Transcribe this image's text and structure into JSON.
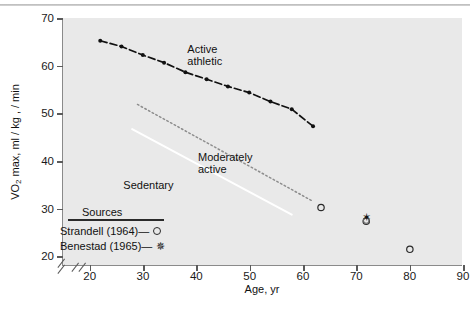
{
  "chart_data": {
    "type": "line",
    "title": "",
    "xlabel": "Age, yr",
    "ylabel": "VO2 max, ml/kg·/min",
    "ylabel_prefix": "VO",
    "ylabel_sub": "2",
    "ylabel_suffix": " max, ml / kg , / min",
    "xlim": [
      15,
      90
    ],
    "ylim": [
      18,
      70
    ],
    "xticks": [
      20,
      30,
      40,
      50,
      60,
      70,
      80,
      90
    ],
    "yticks": [
      20,
      30,
      40,
      50,
      60,
      70
    ],
    "grid": false,
    "legend_position": "inside-lower-left",
    "axis_break_x": true,
    "axis_break_y": true,
    "series": [
      {
        "name": "Active athletic",
        "style": "dash-dot-with-points",
        "color": "#111111",
        "label_lines": [
          "Active",
          "athletic"
        ],
        "x": [
          22,
          26,
          30,
          34,
          38,
          42,
          46,
          50,
          54,
          58,
          62
        ],
        "y": [
          65.2,
          64.0,
          62.2,
          60.6,
          58.6,
          57.1,
          55.6,
          54.3,
          52.4,
          50.8,
          47.2
        ]
      },
      {
        "name": "Moderately active",
        "style": "dotted",
        "color": "#8d8d8d",
        "label_lines": [
          "Moderately",
          "active"
        ],
        "x": [
          29,
          62
        ],
        "y": [
          51.8,
          31.4
        ]
      },
      {
        "name": "Sedentary",
        "style": "solid",
        "color": "#ffffff",
        "label_lines": [
          "Sedentary"
        ],
        "x": [
          28,
          58
        ],
        "y": [
          46.6,
          28.6
        ]
      }
    ],
    "scatter": [
      {
        "marker": "open-circle",
        "source": "Strandell (1964)",
        "x": 63.5,
        "y": 30.1
      },
      {
        "marker": "open-circle",
        "source": "Strandell (1964)",
        "x": 72.0,
        "y": 27.2
      },
      {
        "marker": "open-circle",
        "source": "Strandell (1964)",
        "x": 80.2,
        "y": 21.3
      },
      {
        "marker": "filled-star",
        "source": "Benestad (1965)",
        "x": 72.0,
        "y": 28.0
      }
    ],
    "legend": {
      "title": "Sources",
      "entries": [
        {
          "label": "Strandell (1964)",
          "dash": "—",
          "marker": "open-circle"
        },
        {
          "label": "Benestad (1965)",
          "dash": "—",
          "marker": "filled-star"
        }
      ]
    },
    "colors": {
      "panel_background": "#e9e9e9",
      "page_background": "#ffffff",
      "axis": "#8a8a8a",
      "text": "#111111",
      "active_athletic": "#111111",
      "moderately_active": "#8d8d8d",
      "sedentary": "#ffffff"
    }
  }
}
